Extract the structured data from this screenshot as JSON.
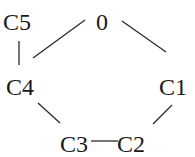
{
  "diagram": {
    "type": "ring-structure",
    "atoms": [
      {
        "id": "C5",
        "label": "C5",
        "x": 3,
        "y": 30
      },
      {
        "id": "O",
        "label": "0",
        "x": 96,
        "y": 30
      },
      {
        "id": "C4",
        "label": "C4",
        "x": 6,
        "y": 95
      },
      {
        "id": "C1",
        "label": "C1",
        "x": 159,
        "y": 95
      },
      {
        "id": "C3",
        "label": "C3",
        "x": 60,
        "y": 152
      },
      {
        "id": "C2",
        "label": "C2",
        "x": 117,
        "y": 152
      }
    ],
    "bonds": [
      {
        "from": "C5",
        "to": "C4"
      },
      {
        "from": "O",
        "to": "C4"
      },
      {
        "from": "O",
        "to": "C1"
      },
      {
        "from": "C4",
        "to": "C3"
      },
      {
        "from": "C3",
        "to": "C2"
      },
      {
        "from": "C2",
        "to": "C1"
      }
    ]
  }
}
